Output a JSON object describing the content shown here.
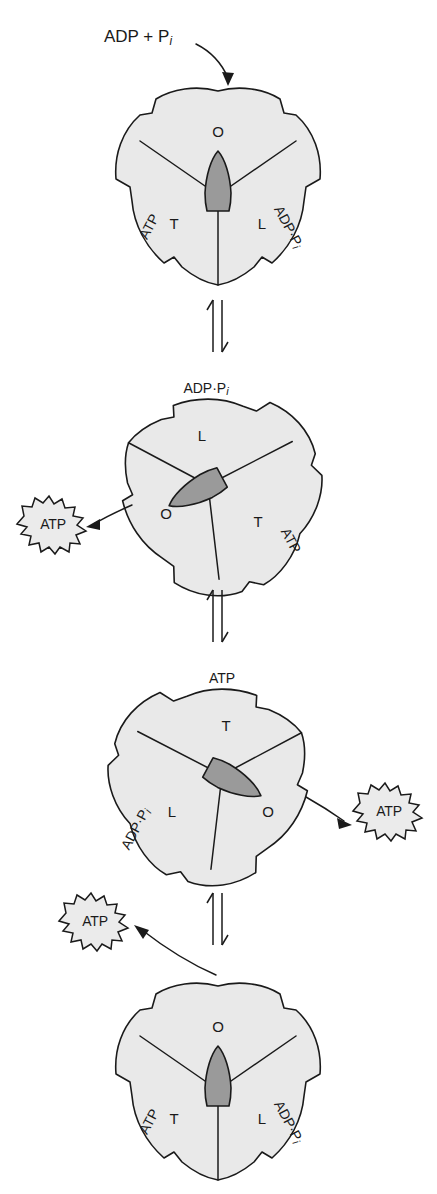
{
  "figure": {
    "width": 437,
    "height": 1194,
    "background_color": "#ffffff",
    "body_fill_color": "#e9e9e9",
    "rotor_fill_color": "#9a9a9a",
    "burst_fill_color": "#ebebeb",
    "outline_color": "#1a1a1a"
  },
  "reactant": {
    "text_main": "ADP + P",
    "text_sub": "i"
  },
  "labels": {
    "atp": "ATP",
    "adp_pi_main": "ADP·P",
    "adp_pi_sub": "i",
    "site_o": "O",
    "site_l": "L",
    "site_t": "T"
  },
  "panels": [
    {
      "id": "panel-1",
      "order": 1,
      "rotation_deg": 0,
      "sites": [
        {
          "position": "top",
          "name": "O",
          "ligand": null
        },
        {
          "position": "lower-left",
          "name": "T",
          "ligand": "ATP"
        },
        {
          "position": "lower-right",
          "name": "L",
          "ligand": "ADP·Pi"
        }
      ],
      "rotor_direction": "up",
      "incoming": "ADP + Pi",
      "outgoing": null
    },
    {
      "id": "panel-2",
      "order": 2,
      "rotation_deg": 120,
      "sites": [
        {
          "position": "top",
          "name": "L",
          "ligand": "ADP·Pi"
        },
        {
          "position": "lower-left",
          "name": "O",
          "ligand": null
        },
        {
          "position": "lower-right",
          "name": "T",
          "ligand": "ATP"
        }
      ],
      "rotor_direction": "lower-left",
      "incoming": null,
      "outgoing": "ATP"
    },
    {
      "id": "panel-3",
      "order": 3,
      "rotation_deg": 240,
      "sites": [
        {
          "position": "top",
          "name": "T",
          "ligand": "ATP"
        },
        {
          "position": "lower-left",
          "name": "L",
          "ligand": "ADP·Pi"
        },
        {
          "position": "lower-right",
          "name": "O",
          "ligand": null
        }
      ],
      "rotor_direction": "lower-right",
      "incoming": null,
      "outgoing": "ATP"
    },
    {
      "id": "panel-4",
      "order": 4,
      "rotation_deg": 360,
      "sites": [
        {
          "position": "top",
          "name": "O",
          "ligand": null
        },
        {
          "position": "lower-left",
          "name": "T",
          "ligand": "ATP"
        },
        {
          "position": "lower-right",
          "name": "L",
          "ligand": "ADP·Pi"
        }
      ],
      "rotor_direction": "up",
      "incoming": null,
      "outgoing": "ATP"
    }
  ],
  "equilibrium_arrows": [
    {
      "id": "equil-1",
      "between": "panel-1 and panel-2"
    },
    {
      "id": "equil-2",
      "between": "panel-2 and panel-3"
    },
    {
      "id": "equil-3",
      "between": "panel-3 and panel-4"
    }
  ]
}
